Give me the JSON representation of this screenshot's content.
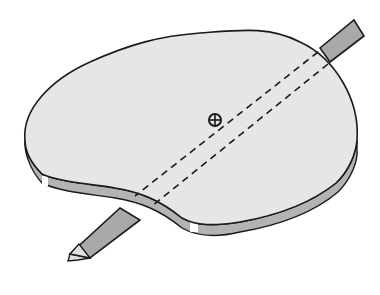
{
  "diagram": {
    "elements": [
      {
        "name": "lamina",
        "description": "irregular flat plate (thick disc)"
      },
      {
        "name": "axis-rod",
        "description": "rod piercing the lamina, with hidden portion shown dashed"
      },
      {
        "name": "center-of-mass-marker",
        "description": "circle with cross"
      }
    ],
    "colors": {
      "lamina_top": "#e6e6e6",
      "lamina_edge": "#b3b3b3",
      "rod": "#a9a9a9",
      "rod_tip": "#e0e0e0",
      "outline": "#1a1a1a",
      "background": "#ffffff"
    }
  }
}
